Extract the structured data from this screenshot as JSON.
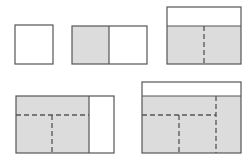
{
  "diagram": {
    "colors": {
      "background": "#ffffff",
      "stroke": "#555555",
      "shade": "#dcdcdc",
      "dash": "#555555"
    },
    "shapes": [
      {
        "id": "square",
        "x": 15,
        "y": 25,
        "w": 38,
        "h": 39,
        "shaded": [],
        "dashed": []
      },
      {
        "id": "rect-two-part",
        "x": 72,
        "y": 26,
        "w": 75,
        "h": 38,
        "shaded": [
          {
            "x": 72,
            "y": 26,
            "w": 37,
            "h": 38
          }
        ],
        "solid_lines": [
          [
            109,
            26,
            109,
            64
          ]
        ],
        "dashed": []
      },
      {
        "id": "rect-top-strip",
        "x": 167,
        "y": 7,
        "w": 74,
        "h": 57,
        "shaded": [
          {
            "x": 167,
            "y": 26,
            "w": 74,
            "h": 38
          }
        ],
        "solid_lines": [
          [
            167,
            26,
            241,
            26
          ]
        ],
        "dashed": [
          [
            204,
            26,
            204,
            64
          ]
        ]
      },
      {
        "id": "rect-right-strip",
        "x": 16,
        "y": 96,
        "w": 98,
        "h": 57,
        "shaded": [
          {
            "x": 16,
            "y": 96,
            "w": 73,
            "h": 57
          }
        ],
        "solid_lines": [
          [
            89,
            96,
            89,
            153
          ]
        ],
        "dashed": [
          [
            16,
            115,
            89,
            115
          ],
          [
            52,
            115,
            52,
            153
          ]
        ]
      },
      {
        "id": "rect-top-strip-large",
        "x": 142,
        "y": 82,
        "w": 99,
        "h": 71,
        "shaded": [
          {
            "x": 142,
            "y": 96,
            "w": 99,
            "h": 57
          }
        ],
        "solid_lines": [
          [
            142,
            96,
            241,
            96
          ]
        ],
        "dashed": [
          [
            142,
            115,
            216,
            115
          ],
          [
            179,
            115,
            179,
            153
          ],
          [
            216,
            96,
            216,
            153
          ]
        ]
      }
    ]
  }
}
